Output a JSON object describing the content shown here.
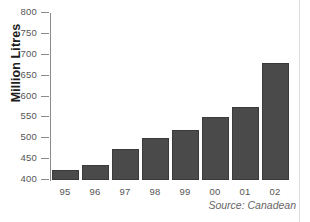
{
  "chart_data": {
    "type": "bar",
    "title": "",
    "xlabel": "",
    "ylabel": "Million Litres",
    "categories": [
      "95",
      "96",
      "97",
      "98",
      "99",
      "00",
      "01",
      "02"
    ],
    "values": [
      425,
      435,
      475,
      500,
      520,
      550,
      575,
      680
    ],
    "ylim": [
      400,
      800
    ],
    "yticks": [
      400,
      450,
      500,
      550,
      600,
      650,
      700,
      750,
      800
    ],
    "ytick_labels": [
      "400",
      "450",
      "500",
      "550",
      "600",
      "650",
      "700",
      "750",
      "800"
    ],
    "grid": false,
    "legend": null,
    "annotations": [
      {
        "name": "source-note",
        "text": "Source: Canadean"
      }
    ],
    "colors": {
      "bar_fill": "#4a4a4a",
      "bar_border": "#3a3a3a",
      "axis": "#8a8a8a",
      "tick_text": "#555555",
      "axis_title": "#1d1d1d",
      "background": "#ffffff"
    }
  }
}
